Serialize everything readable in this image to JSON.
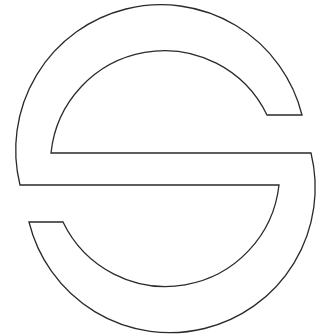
{
  "figure": {
    "title": "S circle logo outline",
    "stroke_color": "#2a2a2a",
    "fill_color": "#ffffff",
    "background": "#ffffff"
  }
}
